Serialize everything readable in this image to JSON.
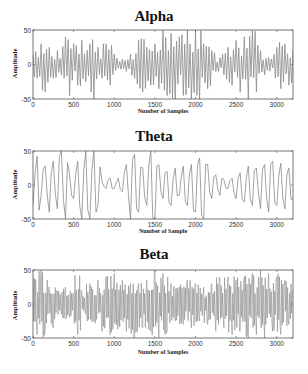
{
  "figure": {
    "width": 308,
    "height": 374,
    "line_color": "#8a8a8a",
    "axis_color": "#555555"
  },
  "chart_data": [
    {
      "type": "line",
      "title": "Alpha",
      "xlabel": "Number of Samples",
      "ylabel": "Amplitude",
      "xlim": [
        0,
        3200
      ],
      "ylim": [
        -50,
        50
      ],
      "xticks": [
        0,
        500,
        1000,
        1500,
        2000,
        2500,
        3000
      ],
      "yticks": [
        -50,
        0,
        50
      ],
      "grid": false,
      "legend": null,
      "series": [
        {
          "name": "Alpha band EEG",
          "x": [
            0,
            50,
            100,
            150,
            200,
            250,
            300,
            350,
            400,
            450,
            500,
            550,
            600,
            650,
            700,
            750,
            800,
            850,
            900,
            950,
            1000,
            1050,
            1100,
            1150,
            1200,
            1250,
            1300,
            1350,
            1400,
            1450,
            1500,
            1550,
            1600,
            1650,
            1700,
            1750,
            1800,
            1850,
            1900,
            1950,
            2000,
            2050,
            2100,
            2150,
            2200,
            2250,
            2300,
            2350,
            2400,
            2450,
            2500,
            2550,
            2600,
            2650,
            2700,
            2750,
            2800,
            2850,
            2900,
            2950,
            3000,
            3050,
            3100,
            3150,
            3200
          ],
          "values": [
            15,
            -20,
            30,
            -40,
            25,
            -20,
            20,
            -15,
            40,
            -45,
            30,
            -30,
            35,
            -25,
            30,
            -50,
            25,
            -20,
            30,
            -30,
            15,
            -5,
            8,
            -10,
            15,
            -20,
            35,
            -40,
            25,
            -30,
            30,
            -35,
            50,
            -45,
            45,
            -50,
            40,
            -45,
            50,
            -50,
            50,
            -50,
            30,
            -35,
            20,
            -10,
            10,
            -15,
            25,
            -30,
            35,
            -40,
            40,
            -50,
            50,
            -40,
            20,
            -15,
            10,
            -5,
            25,
            -35,
            30,
            -30,
            20
          ]
        }
      ]
    },
    {
      "type": "line",
      "title": "Theta",
      "xlabel": "Number of Sample",
      "ylabel": "Amplitude",
      "xlim": [
        0,
        3200
      ],
      "ylim": [
        -50,
        50
      ],
      "xticks": [
        0,
        500,
        1000,
        1500,
        2000,
        2500,
        3000
      ],
      "yticks": [
        -50,
        0,
        50
      ],
      "grid": false,
      "legend": null,
      "series": [
        {
          "name": "Theta band EEG",
          "x": [
            0,
            50,
            100,
            150,
            200,
            250,
            300,
            350,
            400,
            450,
            500,
            550,
            600,
            650,
            700,
            750,
            800,
            850,
            900,
            950,
            1000,
            1050,
            1100,
            1150,
            1200,
            1250,
            1300,
            1350,
            1400,
            1450,
            1500,
            1550,
            1600,
            1650,
            1700,
            1750,
            1800,
            1850,
            1900,
            1950,
            2000,
            2050,
            2100,
            2150,
            2200,
            2250,
            2300,
            2350,
            2400,
            2450,
            2500,
            2550,
            2600,
            2650,
            2700,
            2750,
            2800,
            2850,
            2900,
            2950,
            3000,
            3050,
            3100,
            3150,
            3200
          ],
          "values": [
            -30,
            42,
            -15,
            28,
            -40,
            35,
            -35,
            50,
            -50,
            15,
            -20,
            35,
            -50,
            50,
            -50,
            50,
            -30,
            5,
            -5,
            10,
            -5,
            10,
            -10,
            30,
            -50,
            45,
            -40,
            25,
            -30,
            50,
            -50,
            30,
            -20,
            20,
            -30,
            25,
            -15,
            28,
            -30,
            30,
            -40,
            40,
            -50,
            30,
            -20,
            15,
            -15,
            8,
            -5,
            10,
            -20,
            18,
            -25,
            28,
            -30,
            25,
            -35,
            30,
            -40,
            35,
            -30,
            32,
            -35,
            25,
            -20
          ]
        }
      ]
    },
    {
      "type": "line",
      "title": "Beta",
      "xlabel": "Number of Samples",
      "ylabel": "Amplitude",
      "xlim": [
        0,
        3200
      ],
      "ylim": [
        -50,
        50
      ],
      "xticks": [
        0,
        500,
        1000,
        1500,
        2000,
        2500,
        3000
      ],
      "yticks": [
        -50,
        0,
        50
      ],
      "grid": false,
      "legend": null,
      "series": [
        {
          "name": "Beta band EEG",
          "x": [
            0,
            50,
            100,
            150,
            200,
            250,
            300,
            350,
            400,
            450,
            500,
            550,
            600,
            650,
            700,
            750,
            800,
            850,
            900,
            950,
            1000,
            1050,
            1100,
            1150,
            1200,
            1250,
            1300,
            1350,
            1400,
            1450,
            1500,
            1550,
            1600,
            1650,
            1700,
            1750,
            1800,
            1850,
            1900,
            1950,
            2000,
            2050,
            2100,
            2150,
            2200,
            2250,
            2300,
            2350,
            2400,
            2450,
            2500,
            2550,
            2600,
            2650,
            2700,
            2750,
            2800,
            2850,
            2900,
            2950,
            3000,
            3050,
            3100,
            3150,
            3200
          ],
          "values": [
            40,
            -45,
            50,
            -40,
            25,
            -35,
            20,
            -15,
            25,
            -20,
            15,
            -45,
            20,
            -15,
            30,
            -25,
            35,
            -40,
            40,
            -45,
            45,
            -30,
            35,
            -40,
            30,
            -50,
            30,
            -35,
            35,
            -40,
            50,
            -50,
            45,
            -40,
            30,
            -25,
            25,
            -30,
            35,
            -35,
            30,
            -25,
            25,
            -30,
            30,
            -40,
            35,
            -35,
            40,
            -45,
            35,
            -40,
            40,
            -50,
            45,
            -45,
            50,
            -50,
            45,
            -40,
            40,
            -45,
            35,
            -30,
            20
          ]
        }
      ]
    }
  ],
  "caption_fragment": ""
}
